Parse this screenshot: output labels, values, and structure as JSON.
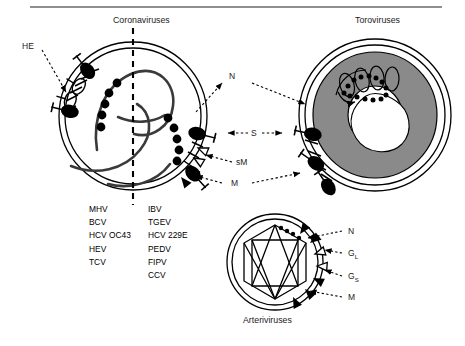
{
  "figure": {
    "panels": {
      "coronaviruses": {
        "title": "Coronaviruses"
      },
      "toroviruses": {
        "title": "Toroviruses"
      },
      "arteriviruses": {
        "title": "Arteriviruses"
      }
    },
    "protein_labels": {
      "he": "HE",
      "n": "N",
      "s": "S",
      "sm": "sM",
      "m": "M"
    },
    "arterivirus_labels": {
      "n": "N",
      "g_large": "G",
      "g_large_sub": "L",
      "g_small": "G",
      "g_small_sub": "S",
      "m": "M"
    },
    "virus_lists": {
      "column_left": [
        "MHV",
        "BCV",
        "HCV OC43",
        "HEV",
        "TCV"
      ],
      "column_right": [
        "IBV",
        "TGEV",
        "HCV 229E",
        "PEDV",
        "FIPV",
        "CCV"
      ]
    },
    "colors": {
      "ink": "#000000",
      "rule": "#8e8e8e",
      "nucleocapsid_fill": "#8a8a8a",
      "background": "#ffffff"
    }
  }
}
